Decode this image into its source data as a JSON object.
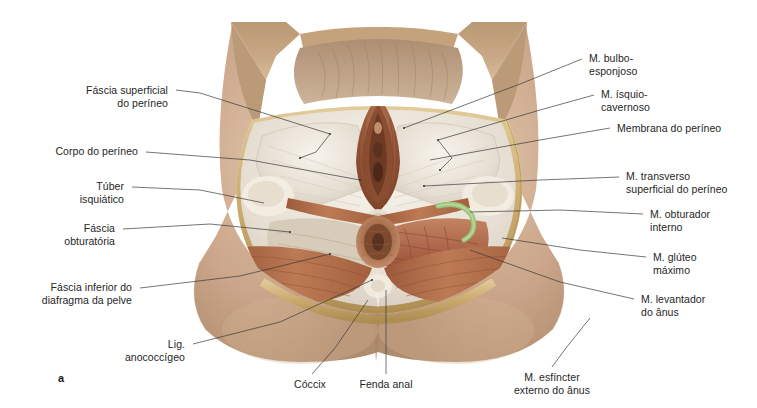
{
  "figure": {
    "panel_letter": "a",
    "background_color": "#ffffff",
    "palette": {
      "skin": "#c8a287",
      "skin_light": "#d8b79c",
      "skin_shadow": "#ab8468",
      "flap_tan": "#c2a078",
      "fat_gold": "#c9a869",
      "fat_gold_light": "#e0c895",
      "fascia_white": "#efe9e0",
      "fascia_shadow": "#cfc5b6",
      "muscle": "#b5714e",
      "muscle_light": "#c8906c",
      "muscle_dark": "#8d4f33",
      "mucosa": "#a05d41",
      "green_vessel": "#9bc47a",
      "leader_line": "#3a3a3a",
      "text": "#262626"
    }
  },
  "labels_left": [
    {
      "name": "fascia-superficial-do-perineo",
      "lines": [
        "Fáscia superficial",
        "do períneo"
      ],
      "text_right_x": 168,
      "text_top_y": 84,
      "leader": [
        [
          176,
          90
        ],
        [
          200,
          93
        ],
        [
          330,
          134
        ]
      ]
    },
    {
      "name": "corpo-do-perineo",
      "lines": [
        "Corpo do períneo"
      ],
      "text_right_x": 138,
      "text_top_y": 145,
      "leader": [
        [
          146,
          152
        ],
        [
          250,
          160
        ],
        [
          360,
          180
        ]
      ]
    },
    {
      "name": "tuber-isquiatico",
      "lines": [
        "Túber",
        "isquiático"
      ],
      "text_right_x": 124,
      "text_top_y": 180,
      "leader": [
        [
          132,
          187
        ],
        [
          200,
          190
        ],
        [
          264,
          203
        ]
      ]
    },
    {
      "name": "fascia-obturatoria",
      "lines": [
        "Fáscia",
        "obturatória"
      ],
      "text_right_x": 115,
      "text_top_y": 222,
      "leader": [
        [
          123,
          229
        ],
        [
          210,
          224
        ],
        [
          290,
          232
        ]
      ]
    },
    {
      "name": "fascia-inferior-do-diafragma-da-pelve",
      "lines": [
        "Fáscia inferior do",
        "diafragma da pelve"
      ],
      "text_right_x": 132,
      "text_top_y": 281,
      "leader": [
        [
          140,
          288
        ],
        [
          240,
          276
        ],
        [
          330,
          254
        ]
      ]
    },
    {
      "name": "lig-anococcigeo",
      "lines": [
        "Lig.",
        "anococcígeo"
      ],
      "text_right_x": 185,
      "text_top_y": 338,
      "leader": [
        [
          193,
          344
        ],
        [
          280,
          322
        ],
        [
          372,
          280
        ]
      ]
    }
  ],
  "labels_right": [
    {
      "name": "m-bulbo-esponjoso",
      "lines": [
        "M. bulbo-",
        "esponjoso"
      ],
      "text_left_x": 589,
      "text_top_y": 52,
      "leader": [
        [
          582,
          59
        ],
        [
          520,
          84
        ],
        [
          404,
          128
        ]
      ]
    },
    {
      "name": "m-isquio-cavernoso",
      "lines": [
        "M. ísquio-",
        "cavernoso"
      ],
      "text_left_x": 601,
      "text_top_y": 88,
      "leader": [
        [
          594,
          95
        ],
        [
          540,
          110
        ],
        [
          438,
          140
        ]
      ]
    },
    {
      "name": "membrana-do-perineo",
      "lines": [
        "Membrana do períneo"
      ],
      "text_left_x": 617,
      "text_top_y": 122,
      "leader": [
        [
          610,
          128
        ],
        [
          540,
          140
        ],
        [
          430,
          160
        ]
      ]
    },
    {
      "name": "m-transverso-superficial-do-perineo",
      "lines": [
        "M. transverso",
        "superficial do períneo"
      ],
      "text_left_x": 626,
      "text_top_y": 170,
      "leader": [
        [
          619,
          177
        ],
        [
          540,
          180
        ],
        [
          424,
          186
        ]
      ]
    },
    {
      "name": "m-obturador-interno",
      "lines": [
        "M. obturador",
        "interno"
      ],
      "text_left_x": 650,
      "text_top_y": 208,
      "leader": [
        [
          643,
          214
        ],
        [
          560,
          210
        ],
        [
          470,
          212
        ]
      ]
    },
    {
      "name": "m-gluteo-maximo",
      "lines": [
        "M. glúteo",
        "máximo"
      ],
      "text_left_x": 653,
      "text_top_y": 251,
      "leader": [
        [
          646,
          257
        ],
        [
          580,
          250
        ],
        [
          502,
          238
        ]
      ]
    },
    {
      "name": "m-levantador-do-anus",
      "lines": [
        "M. levantador",
        "do ânus"
      ],
      "text_left_x": 641,
      "text_top_y": 293,
      "leader": [
        [
          634,
          299
        ],
        [
          560,
          282
        ],
        [
          470,
          250
        ]
      ]
    }
  ],
  "labels_bottom": [
    {
      "name": "coccix",
      "lines": [
        "Cóccix"
      ],
      "text_center_x": 310,
      "text_top_y": 378,
      "leader": [
        [
          312,
          374
        ],
        [
          335,
          348
        ],
        [
          368,
          300
        ]
      ]
    },
    {
      "name": "fenda-anal",
      "lines": [
        "Fenda anal"
      ],
      "text_center_x": 386,
      "text_top_y": 378,
      "leader": [
        [
          386,
          374
        ],
        [
          386,
          340
        ],
        [
          386,
          290
        ]
      ]
    },
    {
      "name": "m-esfincter-externo-do-anus",
      "lines": [
        "M. esfíncter",
        "externo do ânus"
      ],
      "text_center_x": 552,
      "text_top_y": 371,
      "leader": [
        [
          552,
          367
        ],
        [
          566,
          348
        ],
        [
          590,
          318
        ]
      ]
    }
  ]
}
